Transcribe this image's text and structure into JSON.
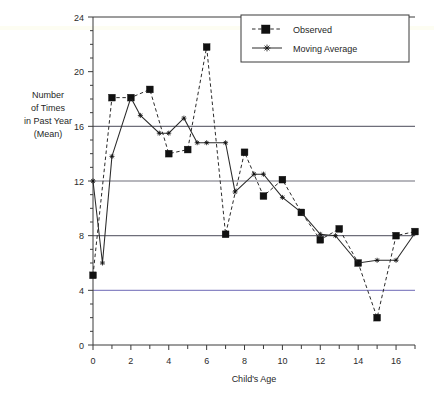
{
  "chart_data": {
    "type": "line",
    "title": "",
    "xlabel": "Child's Age",
    "ylabel": "Number of Times in Past Year (Mean)",
    "ylabel_lines": [
      "Number",
      "of Times",
      "in Past Year",
      "(Mean)"
    ],
    "xlim": [
      0,
      17
    ],
    "ylim": [
      0,
      24
    ],
    "x_major_ticks": [
      0,
      2,
      4,
      6,
      8,
      10,
      12,
      14,
      16
    ],
    "x_minor_ticks": [
      1,
      3,
      5,
      7,
      9,
      11,
      13,
      15,
      17
    ],
    "x_tick_labels": [
      "0",
      "2",
      "4",
      "6",
      "8",
      "10",
      "12",
      "14",
      "16"
    ],
    "y_major_ticks": [
      0,
      4,
      8,
      12,
      16,
      20,
      24
    ],
    "y_tick_labels": [
      "0",
      "4",
      "8",
      "12",
      "16",
      "20",
      "24"
    ],
    "y_minor_step": 1,
    "gridlines_y": [
      4,
      8,
      12,
      16
    ],
    "grid": true,
    "legend_position": "top-right",
    "series": [
      {
        "name": "Observed",
        "marker": "filled-square",
        "linestyle": "dashed",
        "color": "#2a2a2a",
        "x": [
          0,
          1,
          2,
          3,
          4,
          5,
          6,
          7,
          8,
          9,
          10,
          11,
          12,
          13,
          14,
          15,
          16,
          17
        ],
        "values": [
          5.1,
          18.1,
          18.1,
          18.7,
          14.0,
          14.3,
          21.8,
          8.1,
          14.1,
          10.9,
          12.1,
          9.7,
          7.7,
          8.5,
          6.0,
          2.0,
          8.0,
          8.3
        ]
      },
      {
        "name": "Moving Average",
        "marker": "star",
        "linestyle": "solid",
        "color": "#2a2a2a",
        "x": [
          0,
          0.5,
          1,
          2,
          2.5,
          3.5,
          4,
          4.8,
          5.5,
          6,
          7,
          7.5,
          8.5,
          9,
          10,
          11,
          12,
          12.8,
          14,
          15,
          16,
          17
        ],
        "values": [
          12.0,
          6.0,
          13.8,
          18.1,
          16.8,
          15.5,
          15.5,
          16.6,
          14.8,
          14.8,
          14.8,
          11.2,
          12.5,
          12.5,
          10.8,
          9.7,
          8.1,
          8.0,
          6.0,
          6.2,
          6.2,
          8.2
        ]
      }
    ],
    "legend_entries": [
      {
        "label": "Observed",
        "marker": "filled-square",
        "linestyle": "dashed"
      },
      {
        "label": "Moving Average",
        "marker": "star",
        "linestyle": "solid"
      }
    ]
  }
}
